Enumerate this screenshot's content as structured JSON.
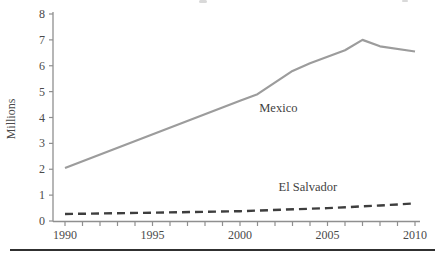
{
  "chart_data": {
    "type": "line",
    "title": "",
    "xlabel": "",
    "ylabel": "Millions",
    "xlim": [
      1990,
      2010
    ],
    "ylim": [
      0,
      8
    ],
    "y_ticks": [
      0,
      1,
      2,
      3,
      4,
      5,
      6,
      7,
      8
    ],
    "x_tick_labels": [
      1990,
      1995,
      2000,
      2005,
      2010
    ],
    "x_minor_tick_step": 1,
    "grid": false,
    "legend": "inline-labels",
    "series": [
      {
        "name": "Mexico",
        "line_style": "solid",
        "color": "#9c9c9c",
        "stroke_width": 2.2,
        "x": [
          1990,
          2000,
          2001,
          2003,
          2004,
          2006,
          2007,
          2008,
          2010
        ],
        "values": [
          2.05,
          4.65,
          4.9,
          5.8,
          6.1,
          6.6,
          7.0,
          6.75,
          6.55
        ],
        "label": "Mexico",
        "label_anchor": {
          "year": 2001.1,
          "value": 4.21
        }
      },
      {
        "name": "El Salvador",
        "line_style": "dashed",
        "color": "#3e3e3e",
        "stroke_width": 2.4,
        "x": [
          1990,
          1995,
          2000,
          2005,
          2008,
          2010
        ],
        "values": [
          0.27,
          0.32,
          0.38,
          0.5,
          0.6,
          0.68
        ],
        "label": "El Salvador",
        "label_anchor": {
          "year": 2002.2,
          "value": 1.16
        }
      }
    ],
    "colors": {
      "axis": "#8f8f8f",
      "tick_text": "#4a4a4a",
      "bottom_rule": "#303030"
    }
  }
}
